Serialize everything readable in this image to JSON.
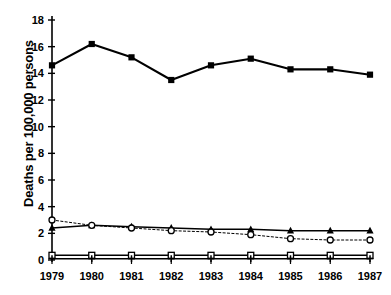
{
  "chart_data": {
    "type": "line",
    "title": "",
    "xlabel": "",
    "ylabel": "Deaths per 100,000 persons",
    "categories": [
      "1979",
      "1980",
      "1981",
      "1982",
      "1983",
      "1984",
      "1985",
      "1986",
      "1987"
    ],
    "x": [
      1979,
      1980,
      1981,
      1982,
      1983,
      1984,
      1985,
      1986,
      1987
    ],
    "xlim": [
      1979,
      1987
    ],
    "ylim": [
      0,
      18
    ],
    "yticks": [
      0,
      2,
      4,
      6,
      8,
      10,
      12,
      14,
      16,
      18
    ],
    "grid": false,
    "legend": "none",
    "series": [
      {
        "name": "series-filled-square",
        "marker": "filled-square",
        "line": "solid",
        "color": "#000000",
        "values": [
          14.6,
          16.2,
          15.2,
          13.5,
          14.6,
          15.1,
          14.3,
          14.3,
          13.9
        ]
      },
      {
        "name": "series-filled-triangle",
        "marker": "filled-triangle",
        "line": "solid",
        "color": "#000000",
        "values": [
          2.4,
          2.6,
          2.5,
          2.4,
          2.3,
          2.3,
          2.2,
          2.2,
          2.2
        ]
      },
      {
        "name": "series-open-circle",
        "marker": "open-circle",
        "line": "dotted",
        "color": "#000000",
        "values": [
          3.0,
          2.6,
          2.4,
          2.2,
          2.1,
          1.9,
          1.6,
          1.5,
          1.5
        ]
      },
      {
        "name": "series-open-square",
        "marker": "open-square",
        "line": "solid",
        "color": "#000000",
        "values": [
          0.35,
          0.35,
          0.35,
          0.35,
          0.35,
          0.35,
          0.35,
          0.35,
          0.35
        ]
      },
      {
        "name": "series-plus",
        "marker": "plus",
        "line": "solid",
        "color": "#000000",
        "values": [
          0.1,
          0.1,
          0.1,
          0.1,
          0.1,
          0.1,
          0.1,
          0.1,
          0.1
        ]
      }
    ]
  },
  "axes": {
    "y_axis_label": "Deaths per 100,000 persons",
    "y_tick_labels": [
      "0",
      "2",
      "4",
      "6",
      "8",
      "10",
      "12",
      "14",
      "16",
      "18"
    ],
    "x_tick_labels": [
      "1979",
      "1980",
      "1981",
      "1982",
      "1983",
      "1984",
      "1985",
      "1986",
      "1987"
    ]
  }
}
